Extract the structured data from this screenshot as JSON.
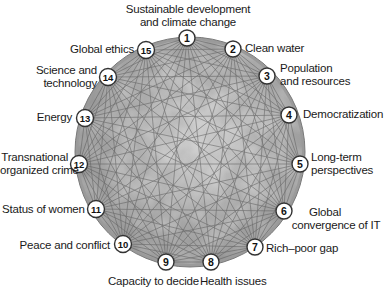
{
  "colors": {
    "globe_fill": "#a8a8a8",
    "globe_rim": "#8c8c8c",
    "line": "#5c5c5c",
    "node_fill": "#ffffff",
    "node_stroke": "#333333",
    "text": "#1a1a1a"
  },
  "nodes": [
    {
      "id": 1,
      "num": "1",
      "line1": "Sustainable development",
      "line2": "and climate change",
      "x": 187,
      "y": 38
    },
    {
      "id": 2,
      "num": "2",
      "line1": "Clean water",
      "line2": "",
      "x": 233,
      "y": 49
    },
    {
      "id": 3,
      "num": "3",
      "line1": "Population",
      "line2": "and resources",
      "x": 267,
      "y": 76
    },
    {
      "id": 4,
      "num": "4",
      "line1": "Democratization",
      "line2": "",
      "x": 289,
      "y": 115
    },
    {
      "id": 5,
      "num": "5",
      "line1": "Long-term",
      "line2": "perspectives",
      "x": 300,
      "y": 164
    },
    {
      "id": 6,
      "num": "6",
      "line1": "Global",
      "line2": "convergence of IT",
      "x": 284,
      "y": 211
    },
    {
      "id": 7,
      "num": "7",
      "line1": "Rich–poor gap",
      "line2": "",
      "x": 255,
      "y": 247
    },
    {
      "id": 8,
      "num": "8",
      "line1": "Health issues",
      "line2": "",
      "x": 211,
      "y": 262
    },
    {
      "id": 9,
      "num": "9",
      "line1": "Capacity to decide",
      "line2": "",
      "x": 166,
      "y": 262
    },
    {
      "id": 10,
      "num": "10",
      "line1": "Peace and conflict",
      "line2": "",
      "x": 123,
      "y": 244
    },
    {
      "id": 11,
      "num": "11",
      "line1": "Status of women",
      "line2": "",
      "x": 96,
      "y": 209
    },
    {
      "id": 12,
      "num": "12",
      "line1": "Transnational",
      "line2": "organized crime",
      "x": 79,
      "y": 164
    },
    {
      "id": 13,
      "num": "13",
      "line1": "Energy",
      "line2": "",
      "x": 85,
      "y": 118
    },
    {
      "id": 14,
      "num": "14",
      "line1": "Science and",
      "line2": "technology",
      "x": 108,
      "y": 77
    },
    {
      "id": 15,
      "num": "15",
      "line1": "Global ethics",
      "line2": "",
      "x": 146,
      "y": 50
    }
  ],
  "globe": {
    "cx": 190,
    "cy": 152,
    "r": 112
  },
  "connection_note": "All 15 challenges are interconnected by a dense mesh of lines"
}
